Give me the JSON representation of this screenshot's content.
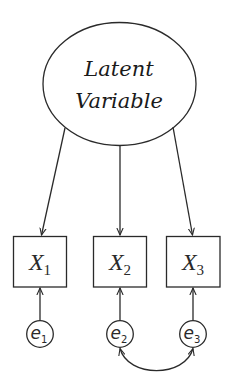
{
  "diagram": {
    "type": "structural-equation-model",
    "colors": {
      "stroke": "#2a2a2a",
      "background": "#ffffff",
      "text": "#1a1a1a"
    },
    "latent": {
      "line1": "Latent",
      "line2": "Variable"
    },
    "observed": [
      {
        "name": "X",
        "subscript": "1"
      },
      {
        "name": "X",
        "subscript": "2"
      },
      {
        "name": "X",
        "subscript": "3"
      }
    ],
    "errors": [
      {
        "name": "e",
        "subscript": "1"
      },
      {
        "name": "e",
        "subscript": "2"
      },
      {
        "name": "e",
        "subscript": "3"
      }
    ],
    "paths": [
      {
        "from": "Latent Variable",
        "to": "X1",
        "kind": "directed"
      },
      {
        "from": "Latent Variable",
        "to": "X2",
        "kind": "directed"
      },
      {
        "from": "Latent Variable",
        "to": "X3",
        "kind": "directed"
      },
      {
        "from": "e1",
        "to": "X1",
        "kind": "directed"
      },
      {
        "from": "e2",
        "to": "X2",
        "kind": "directed"
      },
      {
        "from": "e3",
        "to": "X3",
        "kind": "directed"
      },
      {
        "from": "e2",
        "to": "e3",
        "kind": "covariance"
      }
    ]
  }
}
